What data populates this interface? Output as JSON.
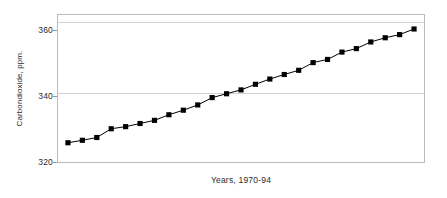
{
  "chart_data": {
    "type": "line",
    "title": "",
    "subtitle": "",
    "xlabel": "Years, 1970-94",
    "ylabel": "Carbondioxide, ppm.",
    "xlim": [
      1970,
      1994
    ],
    "ylim": [
      320,
      362
    ],
    "yticks": [
      320,
      340,
      360
    ],
    "ytick_labels": [
      "320",
      "340",
      "360"
    ],
    "xticks": [],
    "xtick_labels": [],
    "grid": "horizontal",
    "legend": "none",
    "marker": "filled-square",
    "marker_color": "#000000",
    "line_color": "#000000",
    "plot_border_color": "#b9b9bb",
    "gridline_color": "#d2d2d4",
    "background": "#ffffff",
    "categories": [
      "1970",
      "1971",
      "1972",
      "1973",
      "1974",
      "1975",
      "1976",
      "1977",
      "1978",
      "1979",
      "1980",
      "1981",
      "1982",
      "1983",
      "1984",
      "1985",
      "1986",
      "1987",
      "1988",
      "1989",
      "1990",
      "1991",
      "1992",
      "1993",
      "1994"
    ],
    "x": [
      1970,
      1971,
      1972,
      1973,
      1974,
      1975,
      1976,
      1977,
      1978,
      1979,
      1980,
      1981,
      1982,
      1983,
      1984,
      1985,
      1986,
      1987,
      1988,
      1989,
      1990,
      1991,
      1992,
      1993,
      1994
    ],
    "values": [
      325.5,
      326.2,
      327.0,
      329.5,
      330.1,
      331.0,
      331.9,
      333.5,
      334.8,
      336.3,
      338.4,
      339.5,
      340.6,
      342.2,
      343.7,
      345.0,
      346.2,
      348.4,
      349.3,
      351.4,
      352.4,
      354.3,
      355.5,
      356.4,
      358.0
    ],
    "series": [
      {
        "name": "Carbon dioxide",
        "values": [
          325.5,
          326.2,
          327.0,
          329.5,
          330.1,
          331.0,
          331.9,
          333.5,
          334.8,
          336.3,
          338.4,
          339.5,
          340.6,
          342.2,
          343.7,
          345.0,
          346.2,
          348.4,
          349.3,
          351.4,
          352.4,
          354.3,
          355.5,
          356.4,
          358.0
        ]
      }
    ]
  }
}
